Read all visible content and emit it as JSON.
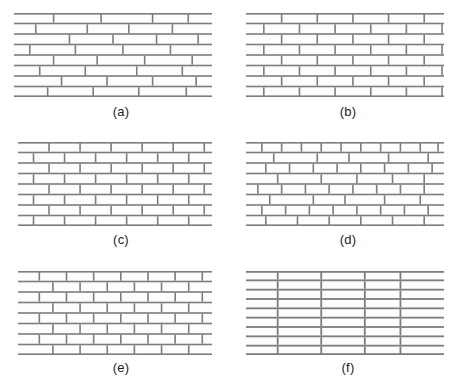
{
  "figure": {
    "width": 465,
    "height": 389,
    "background": "#ffffff",
    "mortar_color": "#7d7d7d",
    "brick_fill": "#fdfdfd",
    "caption_color": "#1c1c1c"
  },
  "panels": [
    {
      "id": "a",
      "caption": "(a)",
      "name": "irregular-random-bond",
      "description": "Irregular running bond with randomly varying stretcher lengths",
      "x": 14,
      "y": 13,
      "width": 198,
      "height": 84,
      "rows": 8,
      "course_height": 10.5,
      "joint_width": 1.6,
      "bond_type": "random",
      "row_joints": [
        [
          0.0,
          0.2,
          0.44,
          0.7,
          0.88,
          1.0
        ],
        [
          0.0,
          0.11,
          0.37,
          0.58,
          0.8,
          1.0
        ],
        [
          0.0,
          0.28,
          0.5,
          0.72,
          0.93,
          1.0
        ],
        [
          0.0,
          0.08,
          0.31,
          0.55,
          0.79,
          1.0
        ],
        [
          0.0,
          0.2,
          0.42,
          0.66,
          0.9,
          1.0
        ],
        [
          0.0,
          0.13,
          0.36,
          0.62,
          0.85,
          1.0
        ],
        [
          0.0,
          0.24,
          0.47,
          0.7,
          0.92,
          1.0
        ],
        [
          0.0,
          0.17,
          0.4,
          0.63,
          0.87,
          1.0
        ]
      ]
    },
    {
      "id": "b",
      "caption": "(b)",
      "name": "running-bond-half-lap",
      "description": "Regular running bond, half-brick offset each course",
      "x": 246,
      "y": 13,
      "width": 198,
      "height": 84,
      "rows": 8,
      "course_height": 10.5,
      "joint_width": 1.6,
      "bond_type": "running-half",
      "row_joints": [
        [
          0.0,
          0.18,
          0.36,
          0.54,
          0.72,
          0.9,
          1.0
        ],
        [
          0.0,
          0.09,
          0.27,
          0.45,
          0.63,
          0.81,
          0.99,
          1.0
        ],
        [
          0.0,
          0.18,
          0.36,
          0.54,
          0.72,
          0.9,
          1.0
        ],
        [
          0.0,
          0.09,
          0.27,
          0.45,
          0.63,
          0.81,
          0.99,
          1.0
        ],
        [
          0.0,
          0.18,
          0.36,
          0.54,
          0.72,
          0.9,
          1.0
        ],
        [
          0.0,
          0.09,
          0.27,
          0.45,
          0.63,
          0.81,
          0.99,
          1.0
        ],
        [
          0.0,
          0.18,
          0.36,
          0.54,
          0.72,
          0.9,
          1.0
        ],
        [
          0.0,
          0.09,
          0.27,
          0.45,
          0.63,
          0.81,
          0.99,
          1.0
        ]
      ]
    },
    {
      "id": "c",
      "caption": "(c)",
      "name": "running-bond-third-lap",
      "description": "Running bond with third-brick offset, slightly varied lengths",
      "x": 18,
      "y": 142,
      "width": 194,
      "height": 84,
      "rows": 8,
      "course_height": 10.5,
      "joint_width": 1.6,
      "bond_type": "running-third",
      "row_joints": [
        [
          0.0,
          0.16,
          0.32,
          0.48,
          0.64,
          0.8,
          0.96,
          1.0
        ],
        [
          0.0,
          0.08,
          0.24,
          0.4,
          0.56,
          0.72,
          0.88,
          1.0
        ],
        [
          0.0,
          0.16,
          0.32,
          0.48,
          0.64,
          0.8,
          0.96,
          1.0
        ],
        [
          0.0,
          0.08,
          0.24,
          0.4,
          0.56,
          0.72,
          0.88,
          1.0
        ],
        [
          0.0,
          0.16,
          0.32,
          0.48,
          0.64,
          0.8,
          0.96,
          1.0
        ],
        [
          0.0,
          0.08,
          0.24,
          0.4,
          0.56,
          0.72,
          0.88,
          1.0
        ],
        [
          0.0,
          0.16,
          0.32,
          0.48,
          0.64,
          0.8,
          0.96,
          1.0
        ],
        [
          0.0,
          0.08,
          0.24,
          0.4,
          0.56,
          0.72,
          0.88,
          1.0
        ]
      ]
    },
    {
      "id": "d",
      "caption": "(d)",
      "name": "mixed-unit-bond",
      "description": "Alternating courses of short headers and long stretchers",
      "x": 246,
      "y": 142,
      "width": 198,
      "height": 84,
      "rows": 8,
      "course_height": 10.5,
      "joint_width": 1.6,
      "bond_type": "mixed",
      "row_joints": [
        [
          0.0,
          0.08,
          0.18,
          0.28,
          0.38,
          0.48,
          0.58,
          0.68,
          0.78,
          0.88,
          0.97,
          1.0
        ],
        [
          0.0,
          0.14,
          0.36,
          0.52,
          0.72,
          0.92,
          1.0
        ],
        [
          0.0,
          0.1,
          0.22,
          0.34,
          0.46,
          0.58,
          0.7,
          0.82,
          0.94,
          1.0
        ],
        [
          0.0,
          0.16,
          0.38,
          0.56,
          0.74,
          0.9,
          1.0
        ],
        [
          0.0,
          0.06,
          0.18,
          0.3,
          0.42,
          0.54,
          0.66,
          0.78,
          0.9,
          1.0
        ],
        [
          0.0,
          0.12,
          0.34,
          0.5,
          0.7,
          0.88,
          1.0
        ],
        [
          0.0,
          0.08,
          0.2,
          0.32,
          0.44,
          0.56,
          0.68,
          0.8,
          0.92,
          1.0
        ],
        [
          0.0,
          0.1,
          0.26,
          0.42,
          0.58,
          0.74,
          0.9,
          1.0
        ]
      ]
    },
    {
      "id": "e",
      "caption": "(e)",
      "name": "uniform-running-bond",
      "description": "Uniform running bond with shorter stretcher units",
      "x": 18,
      "y": 271,
      "width": 194,
      "height": 84,
      "rows": 8,
      "course_height": 10.5,
      "joint_width": 1.6,
      "bond_type": "running-uniform",
      "row_joints": [
        [
          0.0,
          0.11,
          0.25,
          0.39,
          0.53,
          0.67,
          0.81,
          0.95,
          1.0
        ],
        [
          0.0,
          0.18,
          0.32,
          0.46,
          0.6,
          0.74,
          0.88,
          1.0
        ],
        [
          0.0,
          0.11,
          0.25,
          0.39,
          0.53,
          0.67,
          0.81,
          0.95,
          1.0
        ],
        [
          0.0,
          0.18,
          0.32,
          0.46,
          0.6,
          0.74,
          0.88,
          1.0
        ],
        [
          0.0,
          0.11,
          0.25,
          0.39,
          0.53,
          0.67,
          0.81,
          0.95,
          1.0
        ],
        [
          0.0,
          0.18,
          0.32,
          0.46,
          0.6,
          0.74,
          0.88,
          1.0
        ],
        [
          0.0,
          0.11,
          0.25,
          0.39,
          0.53,
          0.67,
          0.81,
          0.95,
          1.0
        ],
        [
          0.0,
          0.18,
          0.32,
          0.46,
          0.6,
          0.74,
          0.88,
          1.0
        ]
      ]
    },
    {
      "id": "f",
      "caption": "(f)",
      "name": "stack-bond",
      "description": "Stack bond with continuous aligned vertical joints",
      "x": 246,
      "y": 271,
      "width": 198,
      "height": 84,
      "rows": 9,
      "course_height": 9.3,
      "joint_width": 1.8,
      "bond_type": "stack",
      "row_joints": [
        [
          0.0,
          0.16,
          0.38,
          0.6,
          0.78,
          1.0
        ],
        [
          0.0,
          0.16,
          0.38,
          0.6,
          0.78,
          1.0
        ],
        [
          0.0,
          0.16,
          0.38,
          0.6,
          0.78,
          1.0
        ],
        [
          0.0,
          0.16,
          0.38,
          0.6,
          0.78,
          1.0
        ],
        [
          0.0,
          0.16,
          0.38,
          0.6,
          0.78,
          1.0
        ],
        [
          0.0,
          0.16,
          0.38,
          0.6,
          0.78,
          1.0
        ],
        [
          0.0,
          0.16,
          0.38,
          0.6,
          0.78,
          1.0
        ],
        [
          0.0,
          0.16,
          0.38,
          0.6,
          0.78,
          1.0
        ],
        [
          0.0,
          0.16,
          0.38,
          0.6,
          0.78,
          1.0
        ]
      ]
    }
  ],
  "captions": [
    {
      "label": "(a)",
      "x": 91,
      "y": 104
    },
    {
      "label": "(b)",
      "x": 318,
      "y": 104
    },
    {
      "label": "(c)",
      "x": 91,
      "y": 232
    },
    {
      "label": "(d)",
      "x": 318,
      "y": 232
    },
    {
      "label": "(e)",
      "x": 91,
      "y": 360
    },
    {
      "label": "(f)",
      "x": 318,
      "y": 360
    }
  ]
}
